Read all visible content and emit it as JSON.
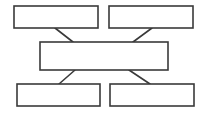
{
  "diagram": {
    "width": 207,
    "height": 113,
    "stroke_color": "#3a3a3a",
    "fill_color": "#ffffff",
    "background": "#ffffff",
    "stroke_width": 1.6,
    "nodes": [
      {
        "id": "top-left",
        "x": 14,
        "y": 6,
        "w": 84,
        "h": 22,
        "label": ""
      },
      {
        "id": "top-right",
        "x": 109,
        "y": 6,
        "w": 84,
        "h": 22,
        "label": ""
      },
      {
        "id": "center",
        "x": 40,
        "y": 42,
        "w": 128,
        "h": 28,
        "label": ""
      },
      {
        "id": "bottom-left",
        "x": 17,
        "y": 84,
        "w": 83,
        "h": 22,
        "label": ""
      },
      {
        "id": "bottom-right",
        "x": 110,
        "y": 84,
        "w": 84,
        "h": 22,
        "label": ""
      }
    ],
    "edges": [
      {
        "from": "top-left",
        "to": "center",
        "x1": 55,
        "y1": 28,
        "x2": 73,
        "y2": 42
      },
      {
        "from": "top-right",
        "to": "center",
        "x1": 152,
        "y1": 28,
        "x2": 133,
        "y2": 42
      },
      {
        "from": "center",
        "to": "bottom-left",
        "x1": 75,
        "y1": 70,
        "x2": 59,
        "y2": 84
      },
      {
        "from": "center",
        "to": "bottom-right",
        "x1": 129,
        "y1": 70,
        "x2": 150,
        "y2": 84
      }
    ]
  }
}
